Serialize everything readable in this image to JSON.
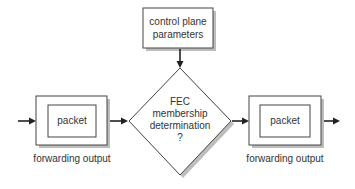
{
  "diagram": {
    "type": "flowchart",
    "nodes": [
      {
        "id": "control",
        "shape": "rect",
        "lines": [
          "control plane",
          "parameters"
        ]
      },
      {
        "id": "fec",
        "shape": "diamond",
        "lines": [
          "FEC",
          "membership",
          "determination",
          "?"
        ]
      },
      {
        "id": "left",
        "shape": "rect-with-inner",
        "inner_label": "packet",
        "caption": "forwarding output"
      },
      {
        "id": "right",
        "shape": "rect-with-inner",
        "inner_label": "packet",
        "caption": "forwarding output"
      }
    ],
    "edges": [
      {
        "from": "input",
        "to": "left"
      },
      {
        "from": "left",
        "to": "fec"
      },
      {
        "from": "control",
        "to": "fec"
      },
      {
        "from": "fec",
        "to": "right"
      },
      {
        "from": "right",
        "to": "output"
      }
    ]
  },
  "labels": {
    "control_line1": "control plane",
    "control_line2": "parameters",
    "fec_line1": "FEC",
    "fec_line2": "membership",
    "fec_line3": "determination",
    "fec_line4": "?",
    "left_packet": "packet",
    "left_caption": "forwarding output",
    "right_packet": "packet",
    "right_caption": "forwarding output"
  },
  "colors": {
    "stroke": "#444444",
    "shadow": "#bdbdbd",
    "text": "#333333",
    "background": "#ffffff"
  }
}
